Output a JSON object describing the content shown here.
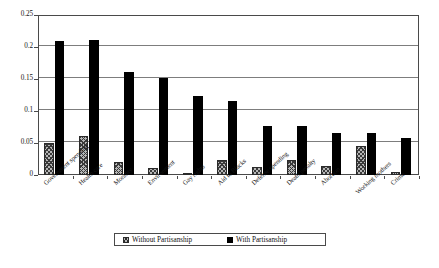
{
  "chart_data": {
    "type": "bar",
    "title": "",
    "subtitle": "",
    "xlabel": "",
    "ylabel": "",
    "ylim": [
      0,
      0.25
    ],
    "ytick_labels": [
      "0",
      "0.05",
      "0.1",
      "0.15",
      "0.2",
      "0.25"
    ],
    "ytick_values": [
      0,
      0.05,
      0.1,
      0.15,
      0.2,
      0.25
    ],
    "grid": true,
    "legend_position": "bottom",
    "categories": [
      "Government spending",
      "Health care",
      "Morality",
      "Environment",
      "Gay rights",
      "Aid to Blacks",
      "Defense spending",
      "Death penalty",
      "Abortion",
      "Working mothers",
      "Crime"
    ],
    "series": [
      {
        "name": "Without Partisanship",
        "pattern": "hatched",
        "color": "#b6b6b6",
        "values": [
          0.05,
          0.061,
          0.021,
          0.011,
          0.002,
          0.024,
          0.013,
          0.023,
          0.014,
          0.046,
          0.004
        ]
      },
      {
        "name": "With Partisanship",
        "pattern": "solid",
        "color": "#000000",
        "values": [
          0.21,
          0.211,
          0.161,
          0.151,
          0.123,
          0.115,
          0.077,
          0.076,
          0.066,
          0.065,
          0.058
        ]
      }
    ]
  },
  "legend": {
    "entries": [
      {
        "label": "Without Partisanship",
        "swatch": "hatched-square-icon"
      },
      {
        "label": "With Partisanship",
        "swatch": "filled-square-icon"
      }
    ]
  }
}
